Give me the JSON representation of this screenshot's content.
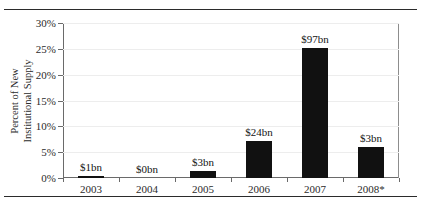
{
  "page": {
    "cutoff_caption": "",
    "rules": [
      "top-rule",
      "bottom-rule"
    ]
  },
  "chart_data": {
    "type": "bar",
    "title": "",
    "xlabel": "",
    "ylabel": "Percent of New Institutional Supply",
    "ylabel_lines": [
      "Percent of New",
      "Institutional Supply"
    ],
    "categories": [
      "2003",
      "2004",
      "2005",
      "2006",
      "2007",
      "2008*"
    ],
    "values": [
      0.4,
      0.0,
      1.3,
      7.2,
      25.2,
      6.0
    ],
    "data_labels": [
      "$1bn",
      "$0bn",
      "$3bn",
      "$24bn",
      "$97bn",
      "$3bn"
    ],
    "ylim": [
      0,
      30
    ],
    "yticks": [
      0,
      5,
      10,
      15,
      20,
      25,
      30
    ],
    "ytick_labels": [
      "0%",
      "5%",
      "10%",
      "15%",
      "20%",
      "25%",
      "30%"
    ],
    "grid": true,
    "legend": null,
    "bar_color": "#111111",
    "axis_color": "#6a6a6a",
    "grid_color": "#ededed"
  }
}
